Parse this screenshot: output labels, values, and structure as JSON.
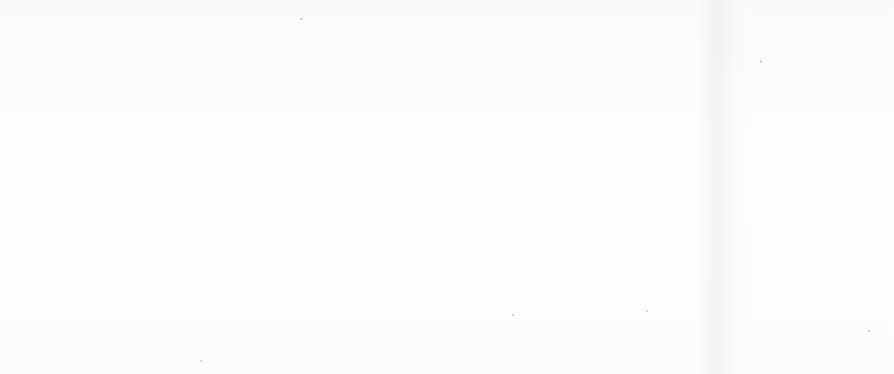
{
  "page": {
    "background_color": "#fdfdfc",
    "ink_color": "#121212"
  },
  "charts": [
    {
      "id": "left",
      "title_line1": "Ratio of Social Security beneficiaries to",
      "title_line2": "covered workers from 1940 to 1975",
      "xlabel": "Year",
      "y_ticks": [
        "0.4",
        "0.3",
        "0.2",
        "0.1",
        "0"
      ],
      "x_ticks": [
        "1940",
        "1945",
        "1950",
        "1955",
        "1960",
        "1965",
        "1970",
        "1975"
      ]
    },
    {
      "id": "right",
      "title_line1": "Ratio of Social Security beneficiaries to",
      "title_line2": "covered workers from 1975 to 1995",
      "xlabel": "Year",
      "y_ticks": [
        "0.4",
        "0.3",
        "0.2",
        "0.1",
        "0"
      ],
      "x_ticks": [
        "1975",
        "1980",
        "1985",
        "1990",
        "1995"
      ]
    }
  ],
  "chart_data": [
    {
      "type": "line",
      "id": "ratio-1940-1975",
      "title": "Ratio of Social Security beneficiaries to covered workers from 1940 to 1975",
      "xlabel": "Year",
      "ylabel": "",
      "xlim": [
        1940,
        1975
      ],
      "ylim": [
        0,
        0.4
      ],
      "xticks": [
        1940,
        1945,
        1950,
        1955,
        1960,
        1965,
        1970,
        1975
      ],
      "yticks": [
        0,
        0.1,
        0.2,
        0.3,
        0.4
      ],
      "minor_xtick_interval": 1,
      "grid": false,
      "legend": "none",
      "line_color": "#121212",
      "x": [
        1940,
        1941,
        1942,
        1943,
        1944,
        1945,
        1946,
        1947,
        1948,
        1949,
        1950,
        1951,
        1952,
        1953,
        1954,
        1955,
        1956,
        1957,
        1958,
        1959,
        1960,
        1961,
        1962,
        1963,
        1964,
        1965,
        1966,
        1967,
        1968,
        1969,
        1970,
        1971,
        1972,
        1973,
        1974,
        1975
      ],
      "values": [
        0.005,
        0.008,
        0.011,
        0.014,
        0.017,
        0.021,
        0.026,
        0.032,
        0.039,
        0.047,
        0.056,
        0.068,
        0.078,
        0.087,
        0.092,
        0.098,
        0.108,
        0.122,
        0.137,
        0.152,
        0.168,
        0.186,
        0.203,
        0.215,
        0.221,
        0.226,
        0.232,
        0.239,
        0.247,
        0.254,
        0.262,
        0.272,
        0.283,
        0.295,
        0.31,
        0.325
      ]
    },
    {
      "type": "line",
      "id": "ratio-1975-1995",
      "title": "Ratio of Social Security beneficiaries to covered workers from 1975 to 1995",
      "xlabel": "Year",
      "ylabel": "",
      "xlim": [
        1975,
        1995
      ],
      "ylim": [
        0,
        0.4
      ],
      "xticks": [
        1975,
        1980,
        1985,
        1990,
        1995
      ],
      "yticks": [
        0,
        0.1,
        0.2,
        0.3,
        0.4
      ],
      "minor_xtick_interval": 1,
      "grid": false,
      "legend": "none",
      "line_color": "#121212",
      "x": [
        1975,
        1976,
        1977,
        1978,
        1979,
        1980,
        1981,
        1982,
        1983,
        1984,
        1985,
        1986,
        1987,
        1988,
        1989,
        1990,
        1991,
        1992,
        1993,
        1994,
        1995
      ],
      "values": [
        0.321,
        0.322,
        0.32,
        0.315,
        0.314,
        0.314,
        0.316,
        0.319,
        0.318,
        0.314,
        0.31,
        0.307,
        0.305,
        0.305,
        0.306,
        0.31,
        0.312,
        0.312,
        0.311,
        0.311,
        0.311
      ]
    }
  ]
}
